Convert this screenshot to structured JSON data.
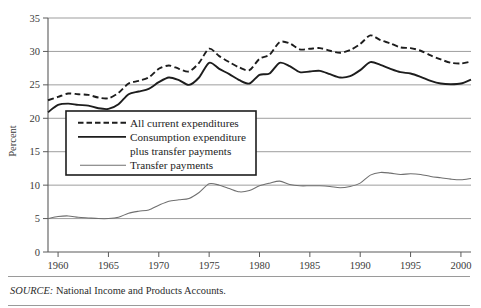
{
  "figure": {
    "title_fragment": "",
    "source_keyword": "SOURCE:",
    "source_text": " National Income and Products Accounts."
  },
  "chart_data": {
    "type": "line",
    "title": "",
    "xlabel": "",
    "ylabel": "Percent",
    "xlim": [
      1959,
      2001
    ],
    "ylim": [
      0,
      35
    ],
    "yticks": [
      0,
      5,
      10,
      15,
      20,
      25,
      30,
      35
    ],
    "xticks": [
      1960,
      1965,
      1970,
      1975,
      1980,
      1985,
      1990,
      1995,
      2000
    ],
    "grid": "horizontal",
    "legend_position": "center-left",
    "x": [
      1959,
      1960,
      1961,
      1962,
      1963,
      1964,
      1965,
      1966,
      1967,
      1968,
      1969,
      1970,
      1971,
      1972,
      1973,
      1974,
      1975,
      1976,
      1977,
      1978,
      1979,
      1980,
      1981,
      1982,
      1983,
      1984,
      1985,
      1986,
      1987,
      1988,
      1989,
      1990,
      1991,
      1992,
      1993,
      1994,
      1995,
      1996,
      1997,
      1998,
      1999,
      2000,
      2001
    ],
    "series": [
      {
        "name": "All current expenditures",
        "style": "dashed",
        "color": "#1d1d1d",
        "values": [
          22.7,
          23.2,
          23.7,
          23.6,
          23.5,
          23.1,
          23.0,
          23.8,
          25.2,
          25.6,
          26.1,
          27.4,
          27.9,
          27.4,
          27.0,
          28.3,
          30.4,
          29.3,
          28.4,
          27.6,
          27.2,
          28.9,
          29.5,
          31.4,
          31.2,
          30.3,
          30.4,
          30.5,
          30.1,
          29.8,
          30.2,
          31.1,
          32.4,
          31.7,
          31.2,
          30.6,
          30.5,
          30.1,
          29.4,
          28.8,
          28.3,
          28.2,
          28.5
        ]
      },
      {
        "name": "Consumption expenditure plus transfer payments",
        "style": "solid-thick",
        "color": "#1d1d1d",
        "values": [
          20.9,
          22.0,
          22.2,
          22.0,
          21.9,
          21.5,
          21.4,
          22.1,
          23.6,
          24.0,
          24.4,
          25.4,
          26.1,
          25.7,
          25.0,
          26.1,
          28.3,
          27.4,
          26.6,
          25.7,
          25.2,
          26.5,
          26.7,
          28.3,
          27.8,
          26.9,
          27.0,
          27.1,
          26.6,
          26.1,
          26.3,
          27.2,
          28.4,
          28.0,
          27.4,
          26.9,
          26.7,
          26.2,
          25.6,
          25.2,
          25.1,
          25.2,
          25.8
        ]
      },
      {
        "name": "Transfer payments",
        "style": "solid-thin",
        "color": "#6f6f6f",
        "values": [
          5.0,
          5.3,
          5.4,
          5.2,
          5.1,
          5.0,
          5.0,
          5.2,
          5.8,
          6.1,
          6.3,
          7.0,
          7.6,
          7.8,
          8.0,
          8.9,
          10.2,
          10.0,
          9.5,
          9.0,
          9.2,
          9.9,
          10.3,
          10.6,
          10.1,
          9.9,
          9.9,
          9.9,
          9.8,
          9.6,
          9.8,
          10.3,
          11.5,
          11.9,
          11.8,
          11.6,
          11.7,
          11.6,
          11.3,
          11.1,
          10.9,
          10.8,
          11.0
        ]
      }
    ]
  },
  "legend": {
    "items": [
      {
        "label": "All current expenditures",
        "style": "dashed"
      },
      {
        "label": "Consumption expenditure",
        "style": "solid-thick"
      },
      {
        "label": "plus transfer payments",
        "style": "continuation"
      },
      {
        "label": "Transfer payments",
        "style": "solid-thin"
      }
    ]
  }
}
